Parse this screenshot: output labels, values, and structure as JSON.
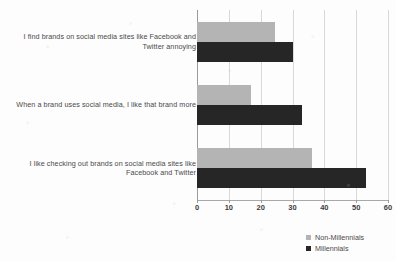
{
  "chart_data": {
    "type": "bar",
    "orientation": "horizontal",
    "title": "",
    "xlabel": "",
    "ylabel": "",
    "xlim": [
      0,
      60
    ],
    "xticks": [
      0,
      10,
      20,
      30,
      40,
      50,
      60
    ],
    "grid": true,
    "legend_position": "bottom-right",
    "categories": [
      "I find brands on social media sites like Facebook and Twitter annoying",
      "When a brand uses social media, I like that brand more",
      "I like checking out brands on social media sites like Facebook and Twitter"
    ],
    "series": [
      {
        "name": "Non-Millennials",
        "color": "#b4b4b4",
        "values": [
          24.5,
          17,
          36
        ]
      },
      {
        "name": "Millennials",
        "color": "#262626",
        "values": [
          30,
          33,
          53
        ]
      }
    ]
  }
}
